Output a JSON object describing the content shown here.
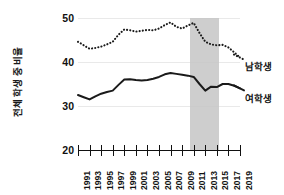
{
  "chart_data": {
    "type": "line",
    "title": "",
    "xlabel": "",
    "ylabel": "전체 학생 중 비율",
    "xlim": [
      1991,
      2019
    ],
    "ylim": [
      20,
      50
    ],
    "y_ticks": [
      20,
      30,
      40,
      50
    ],
    "grid": "horizontal-faint",
    "legend_position": "right-inline",
    "x": [
      1991,
      1992,
      1993,
      1994,
      1995,
      1996,
      1997,
      1998,
      1999,
      2000,
      2001,
      2002,
      2003,
      2004,
      2005,
      2006,
      2007,
      2008,
      2009,
      2010,
      2011,
      2012,
      2013,
      2014,
      2015,
      2016,
      2017,
      2018,
      2019
    ],
    "x_tick_labels": [
      "1991",
      "1993",
      "1995",
      "1997",
      "1999",
      "2001",
      "2003",
      "2005",
      "2007",
      "2009",
      "2011",
      "2013",
      "2015",
      "2017",
      "2019"
    ],
    "series": [
      {
        "name": "남학생",
        "style": "dotted",
        "color": "#1a1a1a",
        "values": [
          44.6,
          43.8,
          43.0,
          43.2,
          43.5,
          44.0,
          44.6,
          46.2,
          47.4,
          47.2,
          46.9,
          47.1,
          47.3,
          47.2,
          47.6,
          48.4,
          49.0,
          48.0,
          47.6,
          48.3,
          48.9,
          46.6,
          44.6,
          44.0,
          43.8,
          43.9,
          43.3,
          42.2,
          41.0
        ]
      },
      {
        "name": "여학생",
        "style": "solid",
        "color": "#1a1a1a",
        "values": [
          32.5,
          32.0,
          31.5,
          32.2,
          32.8,
          33.2,
          33.5,
          34.8,
          36.0,
          36.1,
          35.9,
          35.8,
          35.9,
          36.2,
          36.6,
          37.2,
          37.5,
          37.3,
          37.1,
          36.9,
          36.6,
          35.0,
          33.5,
          34.4,
          34.3,
          35.0,
          35.0,
          34.6,
          34.0
        ]
      }
    ],
    "shaded_regions": [
      {
        "label": "",
        "x_start": 2010.3,
        "x_end": 2015.4,
        "color": "#c6c6c6"
      }
    ],
    "annotations": []
  }
}
